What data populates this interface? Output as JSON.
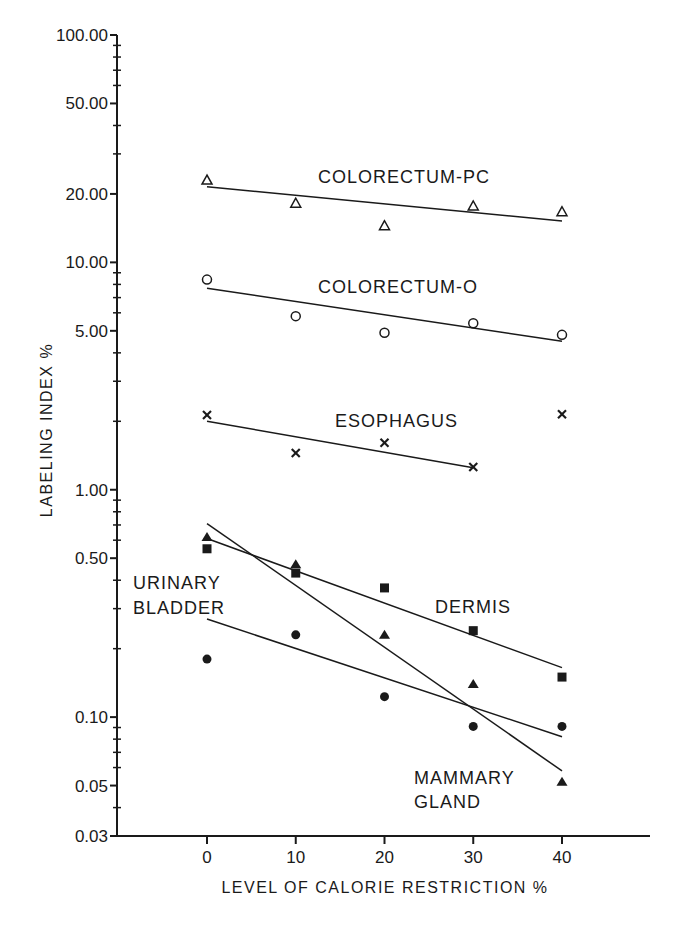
{
  "chart_data": {
    "type": "scatter",
    "title": "",
    "xlabel": "LEVEL OF CALORIE RESTRICTION %",
    "ylabel": "LABELING INDEX %",
    "yscale": "log",
    "ylim": [
      0.03,
      100
    ],
    "xlim": [
      -10,
      50
    ],
    "grid": false,
    "legend_position": "inline labels",
    "x": [
      0,
      10,
      20,
      30,
      40
    ],
    "x_tick_labels": [
      "0",
      "10",
      "20",
      "30",
      "40"
    ],
    "y_tick_labels": [
      "100.00",
      "50.00",
      "20.00",
      "10.00",
      "5.00",
      "1.00",
      "0.50",
      "0.10",
      "0.05",
      "0.03"
    ],
    "series": [
      {
        "name": "COLORECTUM-PC",
        "marker": "open-triangle",
        "values": [
          23.0,
          18.2,
          14.5,
          17.7,
          16.7
        ],
        "fit": {
          "x0": 0,
          "y0": 21.5,
          "x1": 40,
          "y1": 15.2
        }
      },
      {
        "name": "COLORECTUM-O",
        "marker": "open-circle",
        "values": [
          8.4,
          5.8,
          4.9,
          5.4,
          4.8
        ],
        "fit": {
          "x0": 0,
          "y0": 7.7,
          "x1": 40,
          "y1": 4.5
        }
      },
      {
        "name": "ESOPHAGUS",
        "marker": "x",
        "values": [
          2.13,
          1.45,
          1.61,
          1.26,
          2.15
        ],
        "fit": {
          "x0": 0,
          "y0": 2.0,
          "x1": 30,
          "y1": 1.25
        }
      },
      {
        "name": "MAMMARY GLAND",
        "marker": "filled-triangle",
        "values": [
          0.62,
          0.47,
          0.23,
          0.14,
          0.052
        ],
        "fit": {
          "x0": 0,
          "y0": 0.71,
          "x1": 40,
          "y1": 0.058
        }
      },
      {
        "name": "DERMIS",
        "marker": "filled-square",
        "values": [
          0.55,
          0.43,
          0.37,
          0.24,
          0.15
        ],
        "fit": {
          "x0": 0,
          "y0": 0.61,
          "x1": 40,
          "y1": 0.165
        }
      },
      {
        "name": "URINARY BLADDER",
        "marker": "filled-circle",
        "values": [
          0.18,
          0.23,
          0.123,
          0.091,
          0.091
        ],
        "fit": {
          "x0": 0,
          "y0": 0.27,
          "x1": 40,
          "y1": 0.082
        }
      }
    ]
  },
  "labels": {
    "xlabel": "LEVEL OF CALORIE RESTRICTION %",
    "ylabel": "LABELING INDEX %",
    "pc": "COLORECTUM-PC",
    "o": "COLORECTUM-O",
    "esophagus": "ESOPHAGUS",
    "dermis": "DERMIS",
    "urinary_1": "URINARY",
    "urinary_2": "BLADDER",
    "mammary_1": "MAMMARY",
    "mammary_2": "GLAND"
  },
  "colors": {
    "ink": "#1a1a1a",
    "background": "#ffffff"
  }
}
